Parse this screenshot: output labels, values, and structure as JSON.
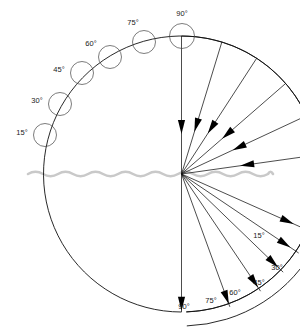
{
  "diagram": {
    "center": {
      "x": 181.5,
      "y": 174
    },
    "main_radius": 138,
    "interface": {
      "name": "water-surface",
      "color": "#c9c9c9",
      "y": 174,
      "x_start": 28,
      "x_end": 273,
      "wavelength": 15,
      "amplitude": 2.2
    },
    "colors": {
      "ray": "#111111",
      "arc": "#111111",
      "bubble": "#444444",
      "arrow": "#000000",
      "label": "#1a1a1a",
      "surface": "#c9c9c9",
      "background": "#ffffff"
    },
    "upper": {
      "name": "incident-rays",
      "arc_start_angle": 8,
      "arc_end_angle": 90,
      "rays": [
        {
          "label": "15°",
          "angle": 8,
          "bubble_cx": 45,
          "bubble_cy": 135,
          "bubble_r": 11.5,
          "label_x": 22,
          "label_y": 133,
          "arrow_t": 0.52
        },
        {
          "label": "30°",
          "angle": 25,
          "bubble_cx": 60,
          "bubble_cy": 104,
          "bubble_r": 11.5,
          "label_x": 37,
          "label_y": 101,
          "arrow_t": 0.54
        },
        {
          "label": "45°",
          "angle": 41,
          "bubble_cx": 82,
          "bubble_cy": 73,
          "bubble_r": 11.5,
          "label_x": 59,
          "label_y": 70,
          "arrow_t": 0.56
        },
        {
          "label": "60°",
          "angle": 57,
          "bubble_cx": 110,
          "bubble_cy": 57,
          "bubble_r": 11.5,
          "label_x": 91,
          "label_y": 44,
          "arrow_t": 0.6
        },
        {
          "label": "75°",
          "angle": 73,
          "bubble_cx": 144,
          "bubble_cy": 42,
          "bubble_r": 11.5,
          "label_x": 133,
          "label_y": 23,
          "arrow_t": 0.63
        },
        {
          "label": "90°",
          "angle": 90,
          "bubble_cx": 182,
          "bubble_cy": 36,
          "bubble_r": 12.5,
          "label_x": 182,
          "label_y": 14,
          "arrow_t": 0.66
        }
      ]
    },
    "lower": {
      "name": "refracted-rays",
      "arc_start_angle": -90,
      "arc_end_angle": -24,
      "rays": [
        {
          "label": "15°",
          "angle": -24,
          "label_x": 259,
          "label_y": 236,
          "arrow_t": 0.82
        },
        {
          "label": "30°",
          "angle": -34,
          "label_x": 277,
          "label_y": 268,
          "arrow_t": 0.88
        },
        {
          "label": "45°",
          "angle": -44,
          "label_x": 259,
          "label_y": 283,
          "arrow_t": 0.9
        },
        {
          "label": "60°",
          "angle": -56,
          "label_x": 235,
          "label_y": 293,
          "arrow_t": 0.92
        },
        {
          "label": "75°",
          "angle": -70,
          "label_x": 211,
          "label_y": 301,
          "arrow_t": 0.93
        },
        {
          "label": "90°",
          "angle": -90,
          "label_x": 184,
          "label_y": 307,
          "arrow_t": 0.94
        }
      ],
      "outer_arc": {
        "name": "outer-refraction-arc",
        "radius": 152,
        "start_angle": -88,
        "end_angle": -27
      }
    }
  },
  "chart_data": {
    "type": "scatter",
    "xlabel": "",
    "ylabel": "",
    "series": [
      {
        "name": "Incident rays (above surface)",
        "angles_deg": [
          15,
          30,
          45,
          60,
          75,
          90
        ],
        "labels": [
          "15°",
          "30°",
          "45°",
          "60°",
          "75°",
          "90°"
        ],
        "direction": "toward-center"
      },
      {
        "name": "Refracted rays (below surface)",
        "angles_deg": [
          15,
          30,
          45,
          60,
          75,
          90
        ],
        "labels": [
          "15°",
          "30°",
          "45°",
          "60°",
          "75°",
          "90°"
        ],
        "direction": "away-from-center"
      }
    ],
    "annotations": [
      "water surface interface"
    ]
  }
}
